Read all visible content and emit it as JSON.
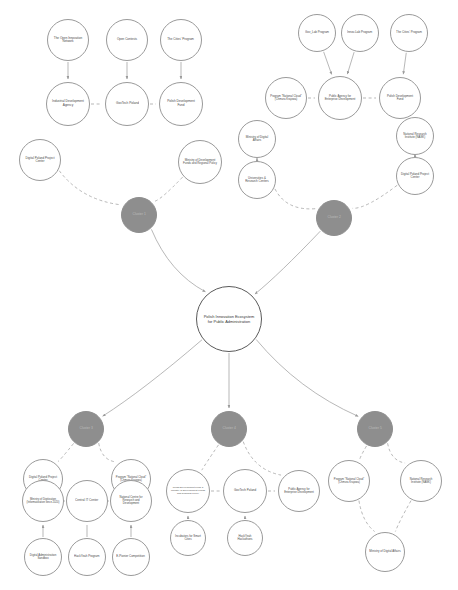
{
  "diagram": {
    "title": "Polish Innovation Ecosystem for Public Administration",
    "type": "node-link-diagram",
    "background_color": "#ffffff",
    "node_stroke_color": "#9a9a9a",
    "cluster_fill_color": "#8e8e8e",
    "center_stroke_color": "#5a5a5a",
    "edge_color": "#9a9a9a"
  },
  "nodes": [
    {
      "id": "open-innovation-network",
      "label": "The Open Innovation Network",
      "kind": "leaf",
      "cx": 68,
      "cy": 40,
      "r": 21,
      "font": 3.3
    },
    {
      "id": "open-contests",
      "label": "Open Contests",
      "kind": "leaf",
      "cx": 127,
      "cy": 40,
      "r": 21,
      "font": 3.3
    },
    {
      "id": "cities-program",
      "label": "The Cities' Program",
      "kind": "leaf",
      "cx": 181,
      "cy": 40,
      "r": 21,
      "font": 3.3
    },
    {
      "id": "industrial-development-agency",
      "label": "Industrial Development Agency",
      "kind": "agency",
      "cx": 68,
      "cy": 104,
      "r": 22,
      "font": 3.4
    },
    {
      "id": "govtech-poland-top",
      "label": "GovTech Poland",
      "kind": "agency",
      "cx": 127,
      "cy": 104,
      "r": 22,
      "font": 3.4
    },
    {
      "id": "polish-development-fund-top",
      "label": "Polish Development Fund",
      "kind": "agency",
      "cx": 181,
      "cy": 104,
      "r": 22,
      "font": 3.4
    },
    {
      "id": "digital-poland-project-center-left",
      "label": "Digital Poland Project Center",
      "kind": "agency",
      "cx": 40,
      "cy": 160,
      "r": 21,
      "font": 3.3
    },
    {
      "id": "ministry-development-funds",
      "label": "Ministry of Development Funds and Regional Policy",
      "kind": "agency",
      "cx": 200,
      "cy": 162,
      "r": 22,
      "font": 3.1
    },
    {
      "id": "cluster-left",
      "label": "Cluster 1",
      "kind": "cluster",
      "cx": 139,
      "cy": 215,
      "r": 18,
      "font": 3.6
    },
    {
      "id": "gov-lab-program",
      "label": "Gov_Lab Program",
      "kind": "leaf",
      "cx": 317,
      "cy": 33,
      "r": 19,
      "font": 3.2
    },
    {
      "id": "innov-lab-program",
      "label": "Innov-Lab Program",
      "kind": "leaf",
      "cx": 360,
      "cy": 33,
      "r": 19,
      "font": 3.2
    },
    {
      "id": "cities-program-right",
      "label": "The Cities' Program",
      "kind": "leaf",
      "cx": 409,
      "cy": 33,
      "r": 19,
      "font": 3.2
    },
    {
      "id": "program-national-cloud-top",
      "label": "Program \"National Cloud\" (Chmura Krajowa)",
      "kind": "agency",
      "cx": 286,
      "cy": 98,
      "r": 21,
      "font": 3.0
    },
    {
      "id": "public-agency-enterprise-top",
      "label": "Public Agency for Enterprise Development",
      "kind": "agency",
      "cx": 340,
      "cy": 98,
      "r": 22,
      "font": 3.1
    },
    {
      "id": "polish-development-fund-right",
      "label": "Polish Development Fund",
      "kind": "agency",
      "cx": 400,
      "cy": 98,
      "r": 21,
      "font": 3.2
    },
    {
      "id": "ministry-digital-affairs-top",
      "label": "Ministry of Digital Affairs",
      "kind": "agency",
      "cx": 257,
      "cy": 139,
      "r": 19,
      "font": 3.2
    },
    {
      "id": "universities-research-centers",
      "label": "Universities & Research Centers",
      "kind": "agency",
      "cx": 257,
      "cy": 180,
      "r": 19,
      "font": 3.2
    },
    {
      "id": "national-research-institute-top",
      "label": "National Research Institute (NASK)",
      "kind": "agency",
      "cx": 415,
      "cy": 136,
      "r": 19,
      "font": 3.1
    },
    {
      "id": "digital-poland-project-center-right",
      "label": "Digital Poland Project Center",
      "kind": "agency",
      "cx": 415,
      "cy": 176,
      "r": 19,
      "font": 3.2
    },
    {
      "id": "cluster-right",
      "label": "Cluster 2",
      "kind": "cluster",
      "cx": 334,
      "cy": 218,
      "r": 18,
      "font": 3.6
    },
    {
      "id": "center-ecosystem",
      "label": "Polish Innovation Ecosystem for Public Administration",
      "kind": "center",
      "cx": 229,
      "cy": 319,
      "r": 33,
      "font": 4.3
    },
    {
      "id": "cluster-bottom-left",
      "label": "Cluster 3",
      "kind": "cluster",
      "cx": 86,
      "cy": 429,
      "r": 18,
      "font": 3.6
    },
    {
      "id": "cluster-bottom-center",
      "label": "Cluster 4",
      "kind": "cluster",
      "cx": 229,
      "cy": 429,
      "r": 18,
      "font": 3.6
    },
    {
      "id": "cluster-bottom-right",
      "label": "Cluster 5",
      "kind": "cluster",
      "cx": 375,
      "cy": 429,
      "r": 18,
      "font": 3.6
    },
    {
      "id": "digital-poland-project-center-bl",
      "label": "Digital Poland Project Center",
      "kind": "agency",
      "cx": 43,
      "cy": 479,
      "r": 20,
      "font": 3.2
    },
    {
      "id": "program-national-cloud-bl",
      "label": "Program \"National Cloud\" (Chmura Krajowa)",
      "kind": "agency",
      "cx": 131,
      "cy": 479,
      "r": 20,
      "font": 2.9
    },
    {
      "id": "ministry-digitization",
      "label": "Ministry of Digitization (Informatization since 2020)",
      "kind": "agency",
      "cx": 43,
      "cy": 501,
      "r": 21,
      "font": 2.9
    },
    {
      "id": "central-it-center",
      "label": "Central IT Center",
      "kind": "agency",
      "cx": 87,
      "cy": 501,
      "r": 21,
      "font": 3.3
    },
    {
      "id": "national-centre-research-development",
      "label": "National Centre for Research and Development",
      "kind": "agency",
      "cx": 131,
      "cy": 501,
      "r": 21,
      "font": 3.0
    },
    {
      "id": "digital-administration-sandbox",
      "label": "Digital Administration Sandbox",
      "kind": "leaf",
      "cx": 43,
      "cy": 557,
      "r": 19,
      "font": 3.1
    },
    {
      "id": "hackyeah-program",
      "label": "HackYeah Program",
      "kind": "leaf",
      "cx": 87,
      "cy": 557,
      "r": 19,
      "font": 3.2
    },
    {
      "id": "e-pionier-competition",
      "label": "E-Pionier Competition",
      "kind": "leaf",
      "cx": 131,
      "cy": 557,
      "r": 19,
      "font": 3.2
    },
    {
      "id": "pdf-ministry-development",
      "label": "Polish Development Fund & Ministry of Development Funds and Regional Policy",
      "kind": "agency",
      "cx": 188,
      "cy": 491,
      "r": 22,
      "font": 2.7
    },
    {
      "id": "govtech-poland-bottom",
      "label": "GovTech Poland",
      "kind": "agency",
      "cx": 245,
      "cy": 491,
      "r": 22,
      "font": 3.3
    },
    {
      "id": "public-agency-enterprise-bottom",
      "label": "Public Agency for Enterprise Development",
      "kind": "agency",
      "cx": 299,
      "cy": 491,
      "r": 21,
      "font": 3.0
    },
    {
      "id": "incubators-smart-cities",
      "label": "Incubators for Smart Cities",
      "kind": "leaf",
      "cx": 188,
      "cy": 538,
      "r": 18,
      "font": 3.1
    },
    {
      "id": "hackyeah-hackathons",
      "label": "HackYeah Hackathons",
      "kind": "leaf",
      "cx": 245,
      "cy": 538,
      "r": 18,
      "font": 3.1
    },
    {
      "id": "program-national-cloud-br",
      "label": "Program \"National Cloud\" (Chmura Krajowa)",
      "kind": "agency",
      "cx": 349,
      "cy": 481,
      "r": 21,
      "font": 2.9
    },
    {
      "id": "national-research-institute-br",
      "label": "National Research Institute (NASK)",
      "kind": "agency",
      "cx": 421,
      "cy": 481,
      "r": 21,
      "font": 3.0
    },
    {
      "id": "ministry-digital-affairs-br",
      "label": "Ministry of Digital Affairs",
      "kind": "agency",
      "cx": 385,
      "cy": 552,
      "r": 20,
      "font": 3.2
    }
  ],
  "edges": [
    {
      "from": "open-innovation-network",
      "to": "industrial-development-agency",
      "style": "solid",
      "arrow": true
    },
    {
      "from": "open-contests",
      "to": "govtech-poland-top",
      "style": "solid",
      "arrow": true
    },
    {
      "from": "cities-program",
      "to": "polish-development-fund-top",
      "style": "solid",
      "arrow": true
    },
    {
      "from": "industrial-development-agency",
      "to": "govtech-poland-top",
      "style": "dashed",
      "arrow": false
    },
    {
      "from": "govtech-poland-top",
      "to": "polish-development-fund-top",
      "style": "dashed",
      "arrow": false
    },
    {
      "from": "digital-poland-project-center-left",
      "to": "cluster-left",
      "style": "dashed",
      "arrow": false
    },
    {
      "from": "ministry-development-funds",
      "to": "cluster-left",
      "style": "dashed",
      "arrow": false
    },
    {
      "from": "gov-lab-program",
      "to": "public-agency-enterprise-top",
      "style": "solid",
      "arrow": true
    },
    {
      "from": "innov-lab-program",
      "to": "public-agency-enterprise-top",
      "style": "solid",
      "arrow": true
    },
    {
      "from": "cities-program-right",
      "to": "polish-development-fund-right",
      "style": "solid",
      "arrow": true
    },
    {
      "from": "program-national-cloud-top",
      "to": "public-agency-enterprise-top",
      "style": "dashed",
      "arrow": false
    },
    {
      "from": "public-agency-enterprise-top",
      "to": "polish-development-fund-right",
      "style": "dashed",
      "arrow": false
    },
    {
      "from": "ministry-digital-affairs-top",
      "to": "universities-research-centers",
      "style": "solid",
      "arrow": true
    },
    {
      "from": "national-research-institute-top",
      "to": "digital-poland-project-center-right",
      "style": "solid",
      "arrow": true
    },
    {
      "from": "universities-research-centers",
      "to": "cluster-right",
      "style": "dashed",
      "arrow": false
    },
    {
      "from": "digital-poland-project-center-right",
      "to": "cluster-right",
      "style": "dashed",
      "arrow": false
    },
    {
      "from": "cluster-left",
      "to": "center-ecosystem",
      "style": "solid",
      "arrow": true
    },
    {
      "from": "cluster-right",
      "to": "center-ecosystem",
      "style": "solid",
      "arrow": true
    },
    {
      "from": "center-ecosystem",
      "to": "cluster-bottom-left",
      "style": "solid",
      "arrow": true
    },
    {
      "from": "center-ecosystem",
      "to": "cluster-bottom-center",
      "style": "solid",
      "arrow": true
    },
    {
      "from": "center-ecosystem",
      "to": "cluster-bottom-right",
      "style": "solid",
      "arrow": true
    },
    {
      "from": "cluster-bottom-left",
      "to": "digital-poland-project-center-bl",
      "style": "dashed",
      "arrow": false
    },
    {
      "from": "cluster-bottom-left",
      "to": "program-national-cloud-bl",
      "style": "dashed",
      "arrow": false
    },
    {
      "from": "digital-poland-project-center-bl",
      "to": "ministry-digitization",
      "style": "solid",
      "arrow": true
    },
    {
      "from": "program-national-cloud-bl",
      "to": "national-centre-research-development",
      "style": "solid",
      "arrow": true
    },
    {
      "from": "ministry-digitization",
      "to": "central-it-center",
      "style": "dashed",
      "arrow": false
    },
    {
      "from": "central-it-center",
      "to": "national-centre-research-development",
      "style": "dashed",
      "arrow": false
    },
    {
      "from": "digital-administration-sandbox",
      "to": "ministry-digitization",
      "style": "solid",
      "arrow": true
    },
    {
      "from": "hackyeah-program",
      "to": "central-it-center",
      "style": "solid",
      "arrow": false
    },
    {
      "from": "e-pionier-competition",
      "to": "national-centre-research-development",
      "style": "solid",
      "arrow": true
    },
    {
      "from": "cluster-bottom-center",
      "to": "pdf-ministry-development",
      "style": "dashed",
      "arrow": false
    },
    {
      "from": "cluster-bottom-center",
      "to": "public-agency-enterprise-bottom",
      "style": "dashed",
      "arrow": false
    },
    {
      "from": "pdf-ministry-development",
      "to": "govtech-poland-bottom",
      "style": "dashed",
      "arrow": false
    },
    {
      "from": "govtech-poland-bottom",
      "to": "public-agency-enterprise-bottom",
      "style": "dashed",
      "arrow": false
    },
    {
      "from": "incubators-smart-cities",
      "to": "pdf-ministry-development",
      "style": "solid",
      "arrow": true
    },
    {
      "from": "hackyeah-hackathons",
      "to": "govtech-poland-bottom",
      "style": "solid",
      "arrow": true
    },
    {
      "from": "cluster-bottom-right",
      "to": "program-national-cloud-br",
      "style": "dashed",
      "arrow": false
    },
    {
      "from": "cluster-bottom-right",
      "to": "national-research-institute-br",
      "style": "dashed",
      "arrow": false
    },
    {
      "from": "program-national-cloud-br",
      "to": "ministry-digital-affairs-br",
      "style": "dashed",
      "arrow": false
    },
    {
      "from": "national-research-institute-br",
      "to": "ministry-digital-affairs-br",
      "style": "dashed",
      "arrow": false
    }
  ]
}
